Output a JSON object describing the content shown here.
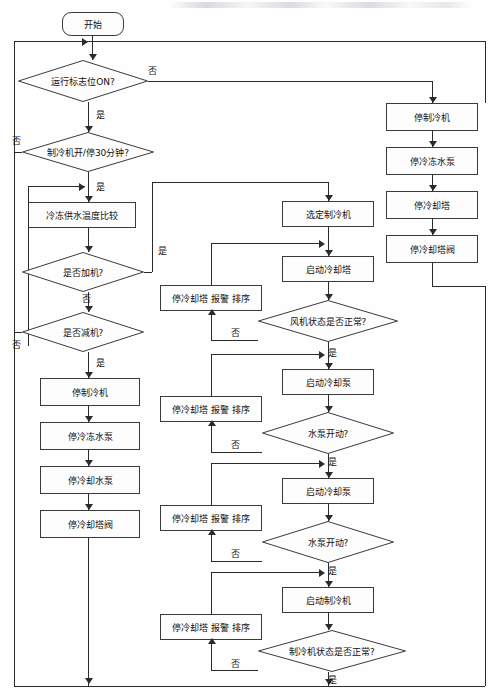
{
  "diagram": {
    "type": "flowchart",
    "font_size_px": 9,
    "edge_labels": {
      "yes": "是",
      "no": "否"
    },
    "nodes": [
      {
        "id": "start",
        "shape": "terminator",
        "label": "开始",
        "x": 62,
        "y": 12,
        "w": 62,
        "h": 24
      },
      {
        "id": "run_flag",
        "shape": "decision",
        "label": "运行标志位ON?",
        "x": 18,
        "y": 60,
        "w": 130,
        "h": 42
      },
      {
        "id": "chiller_30",
        "shape": "decision",
        "label": "制冷机开/停30分钟?",
        "x": 22,
        "y": 132,
        "w": 132,
        "h": 40
      },
      {
        "id": "temp_cmp",
        "shape": "process",
        "label": "冷冻供水温度比较",
        "x": 28,
        "y": 202,
        "w": 108,
        "h": 26
      },
      {
        "id": "add_machine",
        "shape": "decision",
        "label": "是否加机?",
        "x": 22,
        "y": 252,
        "w": 122,
        "h": 40
      },
      {
        "id": "sub_machine",
        "shape": "decision",
        "label": "是否减机?",
        "x": 22,
        "y": 312,
        "w": 122,
        "h": 40
      },
      {
        "id": "stop_chiller_l",
        "shape": "process",
        "label": "停制冷机",
        "x": 40,
        "y": 378,
        "w": 100,
        "h": 28
      },
      {
        "id": "stop_chw_pump_l",
        "shape": "process",
        "label": "停冷冻水泵",
        "x": 40,
        "y": 422,
        "w": 100,
        "h": 28
      },
      {
        "id": "stop_cw_pump_l",
        "shape": "process",
        "label": "停冷却水泵",
        "x": 40,
        "y": 466,
        "w": 100,
        "h": 28
      },
      {
        "id": "stop_ct_valve_l",
        "shape": "process",
        "label": "停冷却塔阀",
        "x": 40,
        "y": 510,
        "w": 100,
        "h": 28
      },
      {
        "id": "stop_chiller_r",
        "shape": "process",
        "label": "停制冷机",
        "x": 386,
        "y": 103,
        "w": 92,
        "h": 28
      },
      {
        "id": "stop_chw_pump_r",
        "shape": "process",
        "label": "停冷冻水泵",
        "x": 386,
        "y": 147,
        "w": 92,
        "h": 28
      },
      {
        "id": "stop_ct_r",
        "shape": "process",
        "label": "停冷却塔",
        "x": 386,
        "y": 191,
        "w": 92,
        "h": 28
      },
      {
        "id": "stop_ct_valve_r",
        "shape": "process",
        "label": "停冷却塔阀",
        "x": 386,
        "y": 235,
        "w": 92,
        "h": 28
      },
      {
        "id": "select_chiller",
        "shape": "process",
        "label": "选定制冷机",
        "x": 282,
        "y": 201,
        "w": 92,
        "h": 26
      },
      {
        "id": "start_ct",
        "shape": "process",
        "label": "启动冷却塔",
        "x": 282,
        "y": 256,
        "w": 92,
        "h": 26
      },
      {
        "id": "fan_ok",
        "shape": "decision",
        "label": "风机状态是否正常?",
        "x": 258,
        "y": 300,
        "w": 140,
        "h": 42
      },
      {
        "id": "alarm1",
        "shape": "process",
        "label": "停冷却塔 报警 排序",
        "x": 160,
        "y": 285,
        "w": 102,
        "h": 26
      },
      {
        "id": "start_cw_pump1",
        "shape": "process",
        "label": "启动冷却泵",
        "x": 282,
        "y": 369,
        "w": 92,
        "h": 26
      },
      {
        "id": "pump_ok1",
        "shape": "decision",
        "label": "水泵开动?",
        "x": 262,
        "y": 412,
        "w": 132,
        "h": 42
      },
      {
        "id": "alarm2",
        "shape": "process",
        "label": "停冷却塔 报警 排序",
        "x": 160,
        "y": 396,
        "w": 102,
        "h": 26
      },
      {
        "id": "start_cw_pump2",
        "shape": "process",
        "label": "启动冷却泵",
        "x": 282,
        "y": 478,
        "w": 92,
        "h": 26
      },
      {
        "id": "pump_ok2",
        "shape": "decision",
        "label": "水泵开动?",
        "x": 262,
        "y": 521,
        "w": 132,
        "h": 42
      },
      {
        "id": "alarm3",
        "shape": "process",
        "label": "停冷却塔 报警 排序",
        "x": 160,
        "y": 505,
        "w": 102,
        "h": 26
      },
      {
        "id": "start_chiller",
        "shape": "process",
        "label": "启动制冷机",
        "x": 282,
        "y": 587,
        "w": 92,
        "h": 26
      },
      {
        "id": "chiller_ok",
        "shape": "decision",
        "label": "制冷机状态是否正常?",
        "x": 258,
        "y": 630,
        "w": 148,
        "h": 42
      },
      {
        "id": "alarm4",
        "shape": "process",
        "label": "停冷却塔 报警 排序",
        "x": 160,
        "y": 614,
        "w": 102,
        "h": 26
      }
    ],
    "edge_label_placements": [
      {
        "text": "否",
        "x": 148,
        "y": 64
      },
      {
        "text": "是",
        "x": 96,
        "y": 108
      },
      {
        "text": "否",
        "x": 12,
        "y": 134
      },
      {
        "text": "是",
        "x": 96,
        "y": 180
      },
      {
        "text": "是",
        "x": 158,
        "y": 244
      },
      {
        "text": "否",
        "x": 82,
        "y": 292
      },
      {
        "text": "否",
        "x": 12,
        "y": 338
      },
      {
        "text": "是",
        "x": 96,
        "y": 356
      },
      {
        "text": "否",
        "x": 231,
        "y": 326
      },
      {
        "text": "是",
        "x": 328,
        "y": 346
      },
      {
        "text": "否",
        "x": 231,
        "y": 438
      },
      {
        "text": "是",
        "x": 328,
        "y": 455
      },
      {
        "text": "否",
        "x": 231,
        "y": 547
      },
      {
        "text": "是",
        "x": 328,
        "y": 564
      },
      {
        "text": "否",
        "x": 231,
        "y": 657
      },
      {
        "text": "是",
        "x": 328,
        "y": 673
      }
    ]
  }
}
